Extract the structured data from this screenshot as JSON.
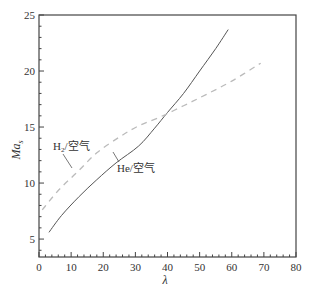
{
  "chart_data": {
    "type": "line",
    "title": "",
    "xlabel": "λ",
    "ylabel": "Ma_s",
    "ylabel_main": "Ma",
    "ylabel_sub": "s",
    "xlim": [
      0,
      80
    ],
    "ylim": [
      3.4,
      25
    ],
    "xticks": [
      0,
      10,
      20,
      30,
      40,
      50,
      60,
      70,
      80
    ],
    "yticks": [
      5,
      10,
      15,
      20,
      25
    ],
    "grid": false,
    "legend": "none (inline annotations)",
    "series": [
      {
        "name": "He/空气",
        "style": "solid",
        "color": "#555555",
        "x": [
          3.1,
          7,
          12.5,
          18,
          24,
          31,
          36,
          40,
          45,
          50,
          55,
          58.9
        ],
        "y": [
          5.6,
          7.1,
          8.8,
          10.3,
          11.8,
          13.3,
          14.9,
          16.3,
          18.0,
          20.0,
          22.0,
          23.7
        ]
      },
      {
        "name": "H₂/空气",
        "style": "dashed",
        "color": "#bbbbbb",
        "x": [
          1,
          6.2,
          12,
          18,
          25,
          31,
          37.7,
          45,
          52,
          60,
          69
        ],
        "y": [
          7.6,
          9.4,
          11.0,
          12.7,
          14.1,
          15.1,
          15.9,
          16.9,
          17.9,
          19.1,
          20.7
        ]
      }
    ],
    "annotations": [
      {
        "text_main": "H",
        "text_sub": "2",
        "text_rest": "/空气",
        "target_series": "H₂/空气"
      },
      {
        "text_main": "He",
        "text_sub": "",
        "text_rest": "/空气",
        "target_series": "He/空气"
      }
    ]
  }
}
